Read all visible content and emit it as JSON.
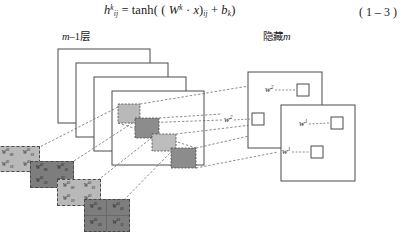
{
  "formula": {
    "lhs_symbol": "h",
    "lhs_sup": "k",
    "lhs_sub": "ij",
    "equals": "=",
    "func": "tanh(",
    "w_symbol": "W",
    "w_sup": "k",
    "dot": "·",
    "x_symbol": "x",
    "close_paren": ")",
    "paren_sub": "ij",
    "plus": "+",
    "b_symbol": "b",
    "b_sub": "k",
    "tail": ")",
    "open_inner": "(",
    "equation_number": "( 1 – 3 )"
  },
  "captions": {
    "left": "m–1层",
    "left_italic": "m",
    "left_rest": "–1层",
    "right": "隐藏m",
    "right_cjk": "隐藏",
    "right_italic": "m"
  },
  "left_stack": {
    "plane_count": 4,
    "planes": [
      {
        "name": "plane-1",
        "x": 58,
        "y": 49,
        "w": 92,
        "h": 74
      },
      {
        "name": "plane-2",
        "x": 76,
        "y": 63,
        "w": 92,
        "h": 74
      },
      {
        "name": "plane-3",
        "x": 94,
        "y": 77,
        "w": 92,
        "h": 74
      },
      {
        "name": "plane-4",
        "x": 112,
        "y": 91,
        "w": 92,
        "h": 74
      }
    ],
    "patches": [
      {
        "name": "receptive-patch-1",
        "x": 118,
        "y": 104,
        "w": 22,
        "h": 19,
        "shade": "#b9b9b9"
      },
      {
        "name": "receptive-patch-2",
        "x": 135,
        "y": 118,
        "w": 24,
        "h": 20,
        "shade": "#8c8c8c"
      },
      {
        "name": "receptive-patch-3",
        "x": 152,
        "y": 134,
        "w": 24,
        "h": 17,
        "shade": "#bdbdbd"
      },
      {
        "name": "receptive-patch-4",
        "x": 171,
        "y": 148,
        "w": 25,
        "h": 20,
        "shade": "#8c8c8c"
      }
    ]
  },
  "kernels": [
    {
      "name": "weight-kernel-1",
      "x": -4,
      "y": 146,
      "w": 44,
      "h": 26,
      "tone": "k-light",
      "grid": false,
      "cells": [
        {
          "sym": "W",
          "sup": "01",
          "sub": "00"
        },
        {
          "sym": "W",
          "sup": "01",
          "sub": "01"
        },
        {
          "sym": "W",
          "sup": "01",
          "sub": "10"
        },
        {
          "sym": "W",
          "sup": "01",
          "sub": "11"
        }
      ]
    },
    {
      "name": "weight-kernel-2",
      "x": 30,
      "y": 161,
      "w": 44,
      "h": 27,
      "tone": "k-dark",
      "grid": false,
      "cells": [
        {
          "sym": "W",
          "sup": "01",
          "sub": "00"
        },
        {
          "sym": "W",
          "sup": "01",
          "sub": "01"
        },
        {
          "sym": "W",
          "sup": "01",
          "sub": "10"
        },
        {
          "sym": "W",
          "sup": "01",
          "sub": "11"
        }
      ]
    },
    {
      "name": "weight-kernel-3",
      "x": 57,
      "y": 179,
      "w": 44,
      "h": 27,
      "tone": "k-light",
      "grid": false,
      "cells": [
        {
          "sym": "W",
          "sup": "01",
          "sub": "00"
        },
        {
          "sym": "W",
          "sup": "01",
          "sub": "01"
        },
        {
          "sym": "W",
          "sup": "01",
          "sub": "10"
        },
        {
          "sym": "W",
          "sup": "01",
          "sub": "11"
        }
      ]
    },
    {
      "name": "weight-kernel-4",
      "x": 84,
      "y": 199,
      "w": 46,
      "h": 33,
      "tone": "k-dark",
      "grid": true,
      "cells": [
        {
          "sym": "W",
          "sup": "01",
          "sub": "00"
        },
        {
          "sym": "W",
          "sup": "01",
          "sub": "01"
        },
        {
          "sym": "W",
          "sup": "01",
          "sub": "10"
        },
        {
          "sym": "W",
          "sup": "01",
          "sub": "11"
        }
      ]
    }
  ],
  "hidden_layer": {
    "boxes": [
      {
        "name": "hidden-box-back",
        "x": 248,
        "y": 72,
        "w": 74,
        "h": 76
      },
      {
        "name": "hidden-box-front",
        "x": 281,
        "y": 105,
        "w": 74,
        "h": 76
      }
    ],
    "units": [
      {
        "name": "hidden-unit-w2-upper",
        "label_sym": "w",
        "label_sup": "2",
        "lx": 265,
        "ly": 88,
        "sx": 297,
        "sy": 84,
        "size": 12
      },
      {
        "name": "hidden-unit-w2-lower",
        "label_sym": "w",
        "label_sup": "2",
        "lx": 224,
        "ly": 118,
        "sx": 252,
        "sy": 113,
        "size": 12
      },
      {
        "name": "hidden-unit-w1-upper",
        "label_sym": "w",
        "label_sup": "1",
        "lx": 299,
        "ly": 122,
        "sx": 331,
        "sy": 117,
        "size": 12
      },
      {
        "name": "hidden-unit-w1-lower",
        "label_sym": "w",
        "label_sup": "1",
        "lx": 282,
        "ly": 150,
        "sx": 311,
        "sy": 146,
        "size": 12
      }
    ]
  },
  "colors": {
    "stroke": "#4a4a4a",
    "dashed": "#5a5a5a",
    "patch_light": "#b9b9b9",
    "patch_dark": "#8c8c8c",
    "background": "#ffffff"
  }
}
